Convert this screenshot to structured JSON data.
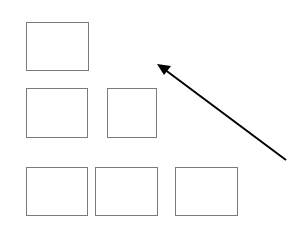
{
  "diagram": {
    "boxes": [
      {
        "id": "box-1",
        "row": 1,
        "x": 26,
        "y": 22,
        "w": 63,
        "h": 49
      },
      {
        "id": "box-2",
        "row": 2,
        "x": 26,
        "y": 88,
        "w": 62,
        "h": 50
      },
      {
        "id": "box-3",
        "row": 2,
        "x": 107,
        "y": 88,
        "w": 50,
        "h": 50
      },
      {
        "id": "box-4",
        "row": 3,
        "x": 26,
        "y": 167,
        "w": 62,
        "h": 49
      },
      {
        "id": "box-5",
        "row": 3,
        "x": 95,
        "y": 167,
        "w": 63,
        "h": 49
      },
      {
        "id": "box-6",
        "row": 3,
        "x": 175,
        "y": 167,
        "w": 63,
        "h": 49
      }
    ],
    "arrow": {
      "from": [
        286,
        160
      ],
      "to": [
        157,
        64
      ],
      "color": "#000000"
    },
    "colors": {
      "box_border": "#7a7a7a",
      "background": "#ffffff"
    }
  }
}
